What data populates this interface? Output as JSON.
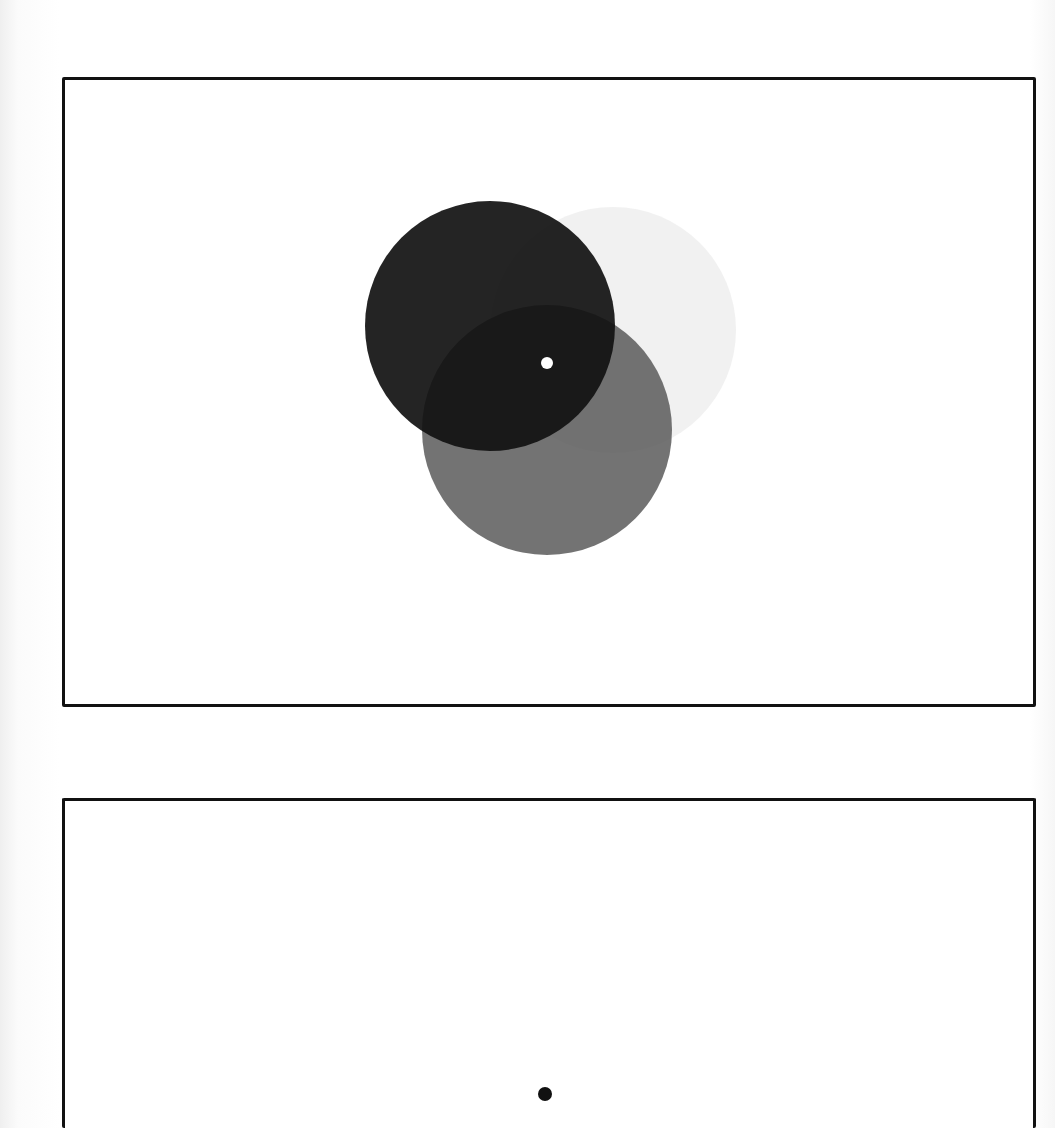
{
  "figure": {
    "panels": [
      {
        "id": "top",
        "description": "Three overlapping translucent discs with a central white fixation point",
        "frame": {
          "x": 62,
          "y": 77,
          "width": 974,
          "height": 630
        },
        "discs": [
          {
            "name": "faint-disc",
            "cx": 613,
            "cy": 330,
            "r": 123,
            "color": "#e6e6e6",
            "opacity": 0.55
          },
          {
            "name": "gray-disc",
            "cx": 547,
            "cy": 430,
            "r": 125,
            "color": "#5a5a5a",
            "opacity": 0.85
          },
          {
            "name": "dark-disc",
            "cx": 490,
            "cy": 326,
            "r": 125,
            "color": "#111111",
            "opacity": 0.92
          }
        ],
        "fixation": {
          "cx": 547,
          "cy": 363,
          "r": 6,
          "color": "#ffffff"
        }
      },
      {
        "id": "bottom",
        "description": "Empty frame with a single black fixation point",
        "frame": {
          "x": 62,
          "y": 798,
          "width": 974,
          "height": 330
        },
        "fixation": {
          "cx": 545,
          "cy": 1094,
          "r": 7,
          "color": "#111111"
        }
      }
    ],
    "colors": {
      "frame": "#111111",
      "background": "#ffffff"
    }
  }
}
